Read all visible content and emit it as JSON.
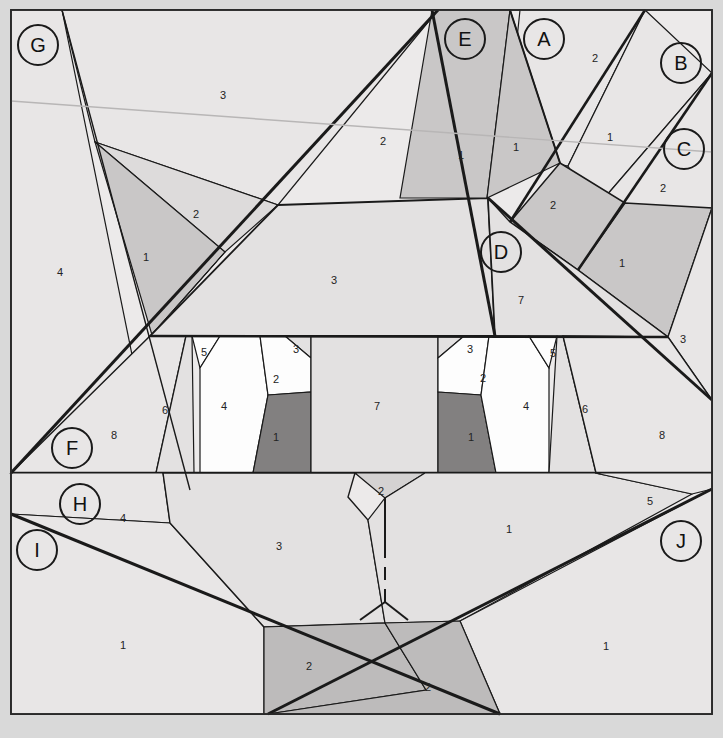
{
  "figure": {
    "width": 723,
    "height": 738,
    "background_color": "#d9d9d9",
    "paper_color": "#eceaea",
    "stroke_color": "#1a1a1a",
    "fills": {
      "light": "#e8e6e6",
      "light2": "#e3e1e1",
      "mid": "#c9c7c7",
      "mid2": "#bdbbbb",
      "dark": "#828080",
      "white": "#fdfdfd"
    }
  },
  "letters": [
    {
      "id": "G",
      "label": "G",
      "x": 38,
      "y": 45
    },
    {
      "id": "E",
      "label": "E",
      "x": 465,
      "y": 39
    },
    {
      "id": "A",
      "label": "A",
      "x": 544,
      "y": 39
    },
    {
      "id": "B",
      "label": "B",
      "x": 681,
      "y": 63
    },
    {
      "id": "C",
      "label": "C",
      "x": 684,
      "y": 149
    },
    {
      "id": "D",
      "label": "D",
      "x": 501,
      "y": 252
    },
    {
      "id": "F",
      "label": "F",
      "x": 72,
      "y": 448
    },
    {
      "id": "H",
      "label": "H",
      "x": 80,
      "y": 504
    },
    {
      "id": "I",
      "label": "I",
      "x": 37,
      "y": 550
    },
    {
      "id": "J",
      "label": "J",
      "x": 681,
      "y": 541
    }
  ],
  "numbers": [
    {
      "value": "3",
      "x": 223,
      "y": 95
    },
    {
      "value": "2",
      "x": 383,
      "y": 141
    },
    {
      "value": "1",
      "x": 461,
      "y": 155
    },
    {
      "value": "1",
      "x": 516,
      "y": 147
    },
    {
      "value": "2",
      "x": 595,
      "y": 58
    },
    {
      "value": "1",
      "x": 610,
      "y": 137
    },
    {
      "value": "2",
      "x": 663,
      "y": 188
    },
    {
      "value": "2",
      "x": 553,
      "y": 205
    },
    {
      "value": "1",
      "x": 622,
      "y": 263
    },
    {
      "value": "2",
      "x": 196,
      "y": 214
    },
    {
      "value": "1",
      "x": 146,
      "y": 257
    },
    {
      "value": "4",
      "x": 60,
      "y": 272
    },
    {
      "value": "3",
      "x": 334,
      "y": 280
    },
    {
      "value": "7",
      "x": 521,
      "y": 300
    },
    {
      "value": "3",
      "x": 683,
      "y": 339
    },
    {
      "value": "5",
      "x": 204,
      "y": 352
    },
    {
      "value": "3",
      "x": 296,
      "y": 349
    },
    {
      "value": "2",
      "x": 276,
      "y": 379
    },
    {
      "value": "4",
      "x": 224,
      "y": 406
    },
    {
      "value": "1",
      "x": 276,
      "y": 437
    },
    {
      "value": "6",
      "x": 165,
      "y": 410
    },
    {
      "value": "8",
      "x": 114,
      "y": 435
    },
    {
      "value": "7",
      "x": 377,
      "y": 406
    },
    {
      "value": "3",
      "x": 470,
      "y": 349
    },
    {
      "value": "2",
      "x": 483,
      "y": 378
    },
    {
      "value": "5",
      "x": 553,
      "y": 353
    },
    {
      "value": "1",
      "x": 471,
      "y": 437
    },
    {
      "value": "4",
      "x": 526,
      "y": 406
    },
    {
      "value": "6",
      "x": 585,
      "y": 409
    },
    {
      "value": "8",
      "x": 662,
      "y": 435
    },
    {
      "value": "2",
      "x": 381,
      "y": 491
    },
    {
      "value": "4",
      "x": 123,
      "y": 518
    },
    {
      "value": "5",
      "x": 650,
      "y": 501
    },
    {
      "value": "3",
      "x": 279,
      "y": 546
    },
    {
      "value": "1",
      "x": 509,
      "y": 529
    },
    {
      "value": "1",
      "x": 123,
      "y": 645
    },
    {
      "value": "1",
      "x": 606,
      "y": 646
    },
    {
      "value": "2",
      "x": 309,
      "y": 666
    },
    {
      "value": "2",
      "x": 428,
      "y": 687
    }
  ]
}
